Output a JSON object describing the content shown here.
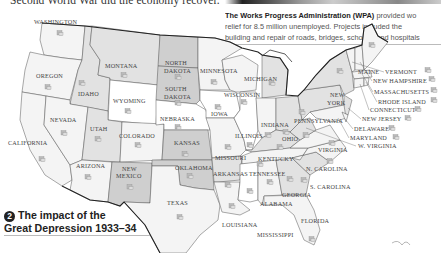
{
  "intro": {
    "text": "Second World War did the economy recover."
  },
  "caption": {
    "bold": "The Works Progress Administration (WPA)",
    "line1_rest": " provided wo",
    "line2": "relief for 8.5 million unemployed. Projects included the",
    "line3": "building and repair of roads, bridges, schools, and hospitals"
  },
  "map": {
    "title_number": "2",
    "title_line1": "The impact of the",
    "title_line2": "Great Depression 1933–34",
    "icon": "wpa-worker-icon",
    "colors": {
      "light": "#f4f4f4",
      "medium": "#e2e2e2",
      "dark": "#cfcfcf",
      "darkest": "#bdbdbd",
      "border": "#222222"
    },
    "states": [
      {
        "name": "WASHINGTON",
        "shade": "light"
      },
      {
        "name": "OREGON",
        "shade": "light"
      },
      {
        "name": "CALIFORNIA",
        "shade": "light"
      },
      {
        "name": "IDAHO",
        "shade": "medium"
      },
      {
        "name": "NEVADA",
        "shade": "light"
      },
      {
        "name": "MONTANA",
        "shade": "medium"
      },
      {
        "name": "WYOMING",
        "shade": "white"
      },
      {
        "name": "UTAH",
        "shade": "medium"
      },
      {
        "name": "COLORADO",
        "shade": "light"
      },
      {
        "name": "ARIZONA",
        "shade": "light"
      },
      {
        "name": "NEW MEXICO",
        "shade": "dark"
      },
      {
        "name": "NORTH DAKOTA",
        "shade": "dark"
      },
      {
        "name": "SOUTH DAKOTA",
        "shade": "dark"
      },
      {
        "name": "NEBRASKA",
        "shade": "white"
      },
      {
        "name": "KANSAS",
        "shade": "dark"
      },
      {
        "name": "OKLAHOMA",
        "shade": "dark"
      },
      {
        "name": "TEXAS",
        "shade": "light"
      },
      {
        "name": "MINNESOTA",
        "shade": "light"
      },
      {
        "name": "IOWA",
        "shade": "white"
      },
      {
        "name": "MISSOURI",
        "shade": "light"
      },
      {
        "name": "ARKANSAS",
        "shade": "medium"
      },
      {
        "name": "LOUISIANA",
        "shade": "light"
      },
      {
        "name": "WISCONSIN",
        "shade": "light"
      },
      {
        "name": "ILLINOIS",
        "shade": "white"
      },
      {
        "name": "MICHIGAN",
        "shade": "medium"
      },
      {
        "name": "INDIANA",
        "shade": "light"
      },
      {
        "name": "OHIO",
        "shade": "medium"
      },
      {
        "name": "KENTUCKY",
        "shade": "medium"
      },
      {
        "name": "TENNESSEE",
        "shade": "light"
      },
      {
        "name": "MISSISSIPPI",
        "shade": "white"
      },
      {
        "name": "ALABAMA",
        "shade": "light"
      },
      {
        "name": "GEORGIA",
        "shade": "medium"
      },
      {
        "name": "FLORIDA",
        "shade": "light"
      },
      {
        "name": "S. CAROLINA",
        "shade": "medium"
      },
      {
        "name": "N. CAROLINA",
        "shade": "light"
      },
      {
        "name": "VIRGINIA",
        "shade": "light"
      },
      {
        "name": "W. VIRGINIA",
        "shade": "medium"
      },
      {
        "name": "PENNSYLVANIA",
        "shade": "medium"
      },
      {
        "name": "NEW YORK",
        "shade": "medium"
      },
      {
        "name": "MAINE",
        "shade": "light"
      },
      {
        "name": "VERMONT",
        "shade": "light"
      },
      {
        "name": "NEW HAMPSHIRE",
        "shade": "light"
      },
      {
        "name": "MASSACHUSETTS",
        "shade": "light"
      },
      {
        "name": "RHODE ISLAND",
        "shade": "light"
      },
      {
        "name": "CONNECTICUT",
        "shade": "light"
      },
      {
        "name": "NEW JERSEY",
        "shade": "medium"
      },
      {
        "name": "DELAWARE",
        "shade": "light"
      },
      {
        "name": "MARYLAND",
        "shade": "light"
      }
    ]
  }
}
